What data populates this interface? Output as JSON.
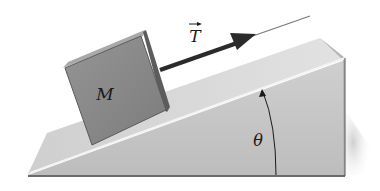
{
  "diagram": {
    "labels": {
      "mass": "M",
      "tension": "T",
      "angle": "θ"
    },
    "elements": [
      {
        "name": "block",
        "label": "M"
      },
      {
        "name": "incline",
        "label": "θ"
      },
      {
        "name": "tension-vector",
        "label": "T"
      }
    ],
    "colors": {
      "block_face": "#8a8a8a",
      "block_top": "#a8a8a8",
      "block_side": "#5e5e5e",
      "incline_top": "#d9d9d9",
      "incline_front": "#c4c4c4",
      "incline_side": "#b8b8b8",
      "arrow": "#2b2b2b"
    }
  }
}
